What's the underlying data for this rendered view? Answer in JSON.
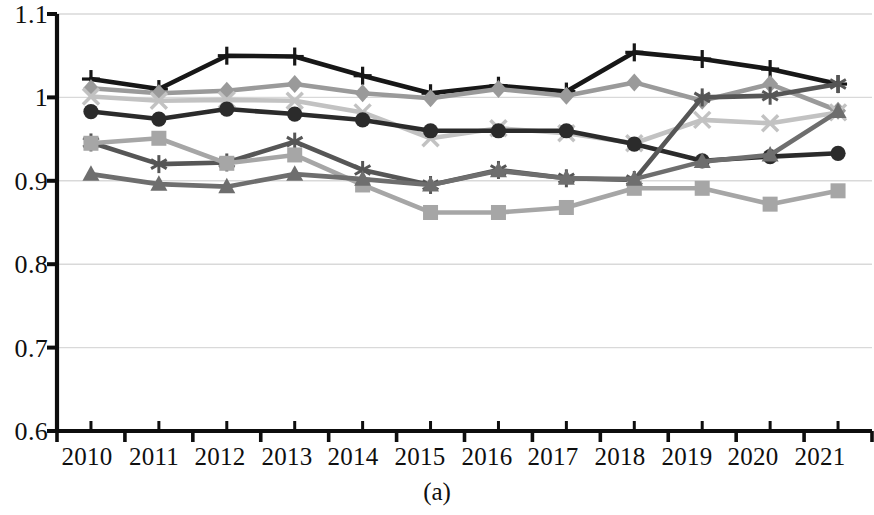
{
  "figure": {
    "caption": "(a)",
    "background_color": "#ffffff",
    "axis_color": "#0d0d0d",
    "gridline_color": "#d9d9d9"
  },
  "axes": {
    "y_ticks": [
      "1.1",
      "1",
      "0.9",
      "0.8",
      "0.7",
      "0.6"
    ],
    "x_ticks": [
      "2010",
      "2011",
      "2012",
      "2013",
      "2014",
      "2015",
      "2016",
      "2017",
      "2018",
      "2019",
      "2020",
      "2021"
    ]
  },
  "chart_data": {
    "type": "line",
    "title": "",
    "subtitle": "",
    "xlabel": "",
    "ylabel": "",
    "caption": "(a)",
    "categories": [
      "2010",
      "2011",
      "2012",
      "2013",
      "2014",
      "2015",
      "2016",
      "2017",
      "2018",
      "2019",
      "2020",
      "2021"
    ],
    "x": [
      2010,
      2011,
      2012,
      2013,
      2014,
      2015,
      2016,
      2017,
      2018,
      2019,
      2020,
      2021
    ],
    "ylim": [
      0.6,
      1.1
    ],
    "yticks": [
      0.6,
      0.7,
      0.8,
      0.9,
      1.0,
      1.1
    ],
    "grid": true,
    "grid_axis": "y",
    "legend": "none",
    "legend_position": "none",
    "series": [
      {
        "name": "series-1",
        "marker": "plus",
        "color": "#171717",
        "values": [
          1.022,
          1.01,
          1.05,
          1.049,
          1.026,
          1.005,
          1.014,
          1.007,
          1.054,
          1.046,
          1.034,
          1.016
        ]
      },
      {
        "name": "series-2",
        "marker": "diamond",
        "color": "#9a9a9a",
        "values": [
          1.011,
          1.005,
          1.008,
          1.016,
          1.005,
          0.999,
          1.01,
          1.002,
          1.018,
          0.996,
          1.016,
          0.984
        ]
      },
      {
        "name": "series-3",
        "marker": "x",
        "color": "#c2c2c2",
        "values": [
          1.001,
          0.996,
          0.997,
          0.996,
          0.982,
          0.951,
          0.963,
          0.957,
          0.945,
          0.973,
          0.969,
          0.982
        ]
      },
      {
        "name": "series-4",
        "marker": "circle",
        "color": "#2b2b2b",
        "values": [
          0.983,
          0.974,
          0.986,
          0.98,
          0.973,
          0.96,
          0.96,
          0.96,
          0.944,
          0.924,
          0.929,
          0.933
        ]
      },
      {
        "name": "series-5",
        "marker": "asterisk",
        "color": "#565656",
        "values": [
          0.946,
          0.92,
          0.922,
          0.947,
          0.913,
          0.895,
          0.913,
          0.903,
          0.901,
          1.0,
          1.002,
          1.016
        ]
      },
      {
        "name": "series-6",
        "marker": "square",
        "color": "#a6a6a6",
        "values": [
          0.945,
          0.951,
          0.921,
          0.931,
          0.895,
          0.862,
          0.862,
          0.868,
          0.891,
          0.891,
          0.872,
          0.888
        ]
      },
      {
        "name": "series-7",
        "marker": "triangle",
        "color": "#6e6e6e",
        "values": [
          0.908,
          0.896,
          0.893,
          0.908,
          0.902,
          0.895,
          0.912,
          0.903,
          0.902,
          0.923,
          0.931,
          0.983
        ]
      }
    ]
  }
}
